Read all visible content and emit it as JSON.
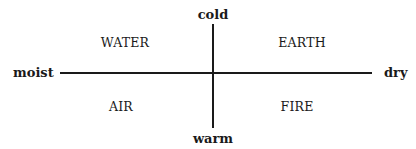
{
  "diagram": {
    "axes": {
      "top": "cold",
      "bottom": "warm",
      "left": "moist",
      "right": "dry"
    },
    "quadrants": {
      "top_left": "WATER",
      "top_right": "EARTH",
      "bottom_left": "AIR",
      "bottom_right": "FIRE"
    }
  }
}
